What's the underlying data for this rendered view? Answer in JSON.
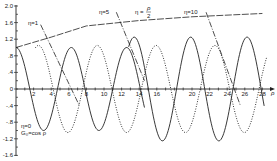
{
  "chart_data": {
    "type": "line",
    "title": "",
    "xlabel": "ρ",
    "ylabel": "",
    "xlim": [
      0,
      29
    ],
    "ylim": [
      -1.6,
      2.0
    ],
    "grid": false,
    "x_ticks": [
      "2",
      "4",
      "6",
      "8",
      "10",
      "12",
      "14",
      "16",
      "20",
      "22",
      "24",
      "26",
      "28"
    ],
    "y_ticks": [
      "2.0",
      "1.6",
      "1.2",
      ".8",
      ".4",
      "0",
      "-.4",
      "-.8",
      "-1.2",
      "-1.6"
    ],
    "annotations": [
      {
        "text": "η=0",
        "at": [
          3.2,
          -1.12
        ]
      },
      {
        "text": "G₀=cos ρ",
        "at": [
          3.2,
          -1.3
        ]
      },
      {
        "text": "η=1",
        "at": [
          2.8,
          1.62
        ]
      },
      {
        "text": "η=5",
        "at": [
          11.5,
          1.86
        ]
      },
      {
        "text": "η = ρ/2",
        "at": [
          16.5,
          1.86
        ]
      },
      {
        "text": "η=10",
        "at": [
          22.0,
          1.86
        ]
      }
    ],
    "series": [
      {
        "name": "η=0 (G₀ = cos ρ)",
        "style": "solid",
        "function": "cos(ρ)",
        "x_range": [
          0,
          14.5
        ]
      },
      {
        "name": "oscillating solution (dotted)",
        "style": "dotted",
        "amplitude_approx": 1.05
      },
      {
        "name": "oscillating solution (solid, growing amplitude)",
        "style": "solid",
        "amplitude_approx": 1.25
      },
      {
        "name": "envelope η = ρ/2",
        "style": "dashed",
        "points_approx": [
          [
            0,
            1.0
          ],
          [
            4,
            1.25
          ],
          [
            8,
            1.52
          ],
          [
            14,
            1.65
          ],
          [
            20,
            1.74
          ],
          [
            28,
            1.82
          ]
        ]
      },
      {
        "name": "η=1 marker line",
        "style": "dash-dot",
        "points_approx": [
          [
            2.8,
            1.55
          ],
          [
            7.2,
            -0.4
          ]
        ]
      },
      {
        "name": "η=5 marker line",
        "style": "dash-dot",
        "points_approx": [
          [
            11.4,
            1.85
          ],
          [
            14.6,
            0.2
          ]
        ]
      },
      {
        "name": "η=10 marker line",
        "style": "dash-dot",
        "points_approx": [
          [
            21.6,
            1.85
          ],
          [
            25.5,
            -0.4
          ]
        ]
      }
    ]
  },
  "labels": {
    "x_axis_symbol": "ρ",
    "eta0": "η=0",
    "g0": "G₀=cos ρ",
    "eta1": "η=1",
    "eta5": "η=5",
    "eta_half": "η =",
    "eta_half_num": "ρ",
    "eta_half_den": "2",
    "eta10": "η=10"
  }
}
